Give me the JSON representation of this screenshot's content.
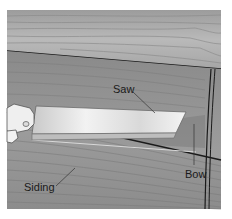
{
  "figure": {
    "labels": {
      "saw": "Saw",
      "bow": "Bow",
      "siding": "Siding"
    },
    "colors": {
      "wood_light": "#b8b8b8",
      "wood_dark": "#8e8e8e",
      "blade_light": "#e8e8e8",
      "blade_dark": "#a9a9a9",
      "outline": "#1a1a1a",
      "background": "#ffffff"
    }
  }
}
